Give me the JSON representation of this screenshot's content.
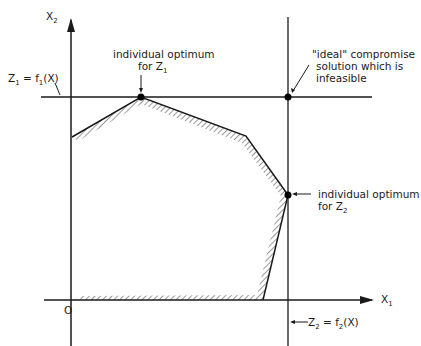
{
  "diagram": {
    "axis_x_label": "X",
    "axis_x_sub": "1",
    "axis_y_label": "X",
    "axis_y_sub": "2",
    "origin_label": "O",
    "z1_line_label": {
      "a": "Z",
      "a_sub": "1",
      "b": " = f",
      "b_sub": "1",
      "c": "(X)"
    },
    "z2_line_label": {
      "a": "Z",
      "a_sub": "2",
      "b": " = f",
      "b_sub": "2",
      "c": "(X)"
    },
    "opt_z1_line1": "individual optimum",
    "opt_z1_line2": "for  Z",
    "opt_z1_sub": "1",
    "opt_z2_line1": "individual optimum",
    "opt_z2_line2": "for  Z",
    "opt_z2_sub": "2",
    "ideal_line1": "\"ideal\" compromise",
    "ideal_line2": "solution which is",
    "ideal_line3": "infeasible"
  },
  "geometry": {
    "feasible_region": [
      [
        72,
        137
      ],
      [
        141,
        97
      ],
      [
        246,
        136
      ],
      [
        288,
        195
      ],
      [
        263,
        300
      ],
      [
        74,
        300
      ]
    ],
    "points": {
      "opt_z1": [
        141,
        97
      ],
      "opt_z2": [
        288,
        195
      ],
      "ideal": [
        288,
        97
      ]
    }
  }
}
